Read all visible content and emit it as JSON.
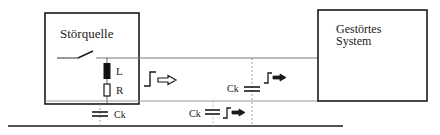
{
  "diagram": {
    "source_box": {
      "label": "Störquelle"
    },
    "target_box": {
      "label_line1": "Gestörtes",
      "label_line2": "System"
    },
    "components": {
      "inductor_label": "L",
      "resistor_label": "R"
    },
    "coupling_capacitors": [
      {
        "label": "Ck",
        "position": "ground-left"
      },
      {
        "label": "Ck",
        "position": "ground-middle"
      },
      {
        "label": "Ck",
        "position": "line-to-line"
      }
    ],
    "signals": [
      {
        "icon": "step-pulse-arrow-icon",
        "position": "source-output"
      },
      {
        "icon": "step-pulse-arrow-icon",
        "position": "line-coupling"
      },
      {
        "icon": "step-pulse-arrow-icon",
        "position": "ground-coupling"
      }
    ],
    "colors": {
      "stroke": "#1a1a1a",
      "wire": "#555555",
      "dashed": "#888888"
    }
  }
}
